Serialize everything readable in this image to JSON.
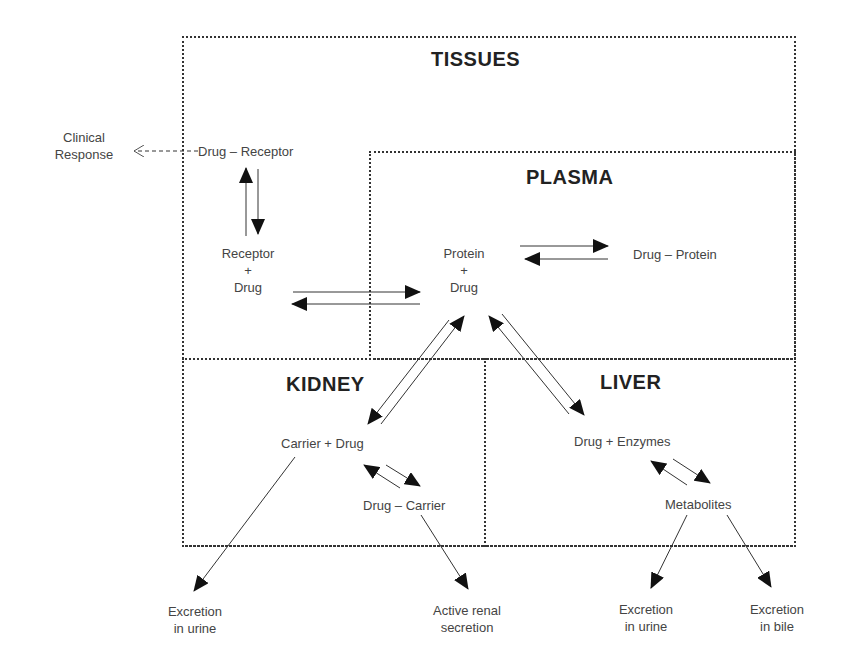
{
  "compartments": {
    "tissues": "TISSUES",
    "plasma": "PLASMA",
    "kidney": "KIDNEY",
    "liver": "LIVER"
  },
  "labels": {
    "clinical_response_1": "Clinical",
    "clinical_response_2": "Response",
    "drug_receptor": "Drug – Receptor",
    "receptor": "Receptor",
    "plus": "+",
    "drug": "Drug",
    "protein": "Protein",
    "drug_protein": "Drug – Protein",
    "carrier_drug": "Carrier + Drug",
    "drug_carrier": "Drug – Carrier",
    "drug_enzymes": "Drug + Enzymes",
    "metabolites": "Metabolites",
    "excretion": "Excretion",
    "in_urine": "in urine",
    "in_bile": "in bile",
    "active_renal": "Active renal",
    "secretion": "secretion"
  }
}
